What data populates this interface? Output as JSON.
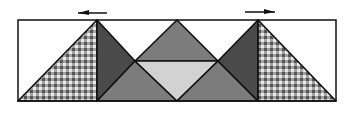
{
  "diagram": {
    "colors": {
      "background": "#ffffff",
      "outline": "#111111",
      "dark": "#4a4a4a",
      "medium": "#7c7c7c",
      "light": "#d2d2d2",
      "gingham_base": "#e8e8e8",
      "gingham_stripe": "#8a8a8a",
      "gingham_cross": "#555555"
    },
    "frame": {
      "x": 18,
      "y": 20,
      "width": 318,
      "height": 81
    },
    "arrows": [
      {
        "name": "left-arrow",
        "direction": "left",
        "x1": 107,
        "x2": 78,
        "y": 13
      },
      {
        "name": "right-arrow",
        "direction": "right",
        "x1": 245,
        "x2": 275,
        "y": 12
      }
    ],
    "pieces": [
      {
        "name": "left-gingham-triangle",
        "fill": "gingham",
        "points": "18,101 97,20 97,101"
      },
      {
        "name": "left-dark-triangle",
        "fill": "dark",
        "points": "97,20 97,101 135,61"
      },
      {
        "name": "left-lower-medium-triangle",
        "fill": "medium",
        "points": "97,101 135,61 177,101"
      },
      {
        "name": "top-medium-triangle",
        "fill": "medium",
        "points": "135,61 177,20 218,61"
      },
      {
        "name": "center-light-triangle",
        "fill": "light",
        "points": "135,61 218,61 177,101"
      },
      {
        "name": "right-lower-medium-triangle",
        "fill": "medium",
        "points": "177,101 218,61 258,101"
      },
      {
        "name": "right-dark-triangle",
        "fill": "dark",
        "points": "258,20 258,101 218,61"
      },
      {
        "name": "right-gingham-triangle",
        "fill": "gingham",
        "points": "258,20 258,101 336,101"
      }
    ]
  }
}
